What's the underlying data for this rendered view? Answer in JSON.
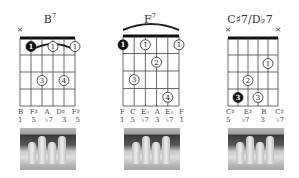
{
  "chords": [
    {
      "name": "B",
      "superscript": "7",
      "muted_strings": [
        1
      ],
      "barre": {
        "fret": 1,
        "from_string": 2,
        "to_string": 6
      },
      "dots": [
        {
          "string": 2,
          "fret": 1,
          "finger": "1",
          "filled": true
        },
        {
          "string": 4,
          "fret": 1,
          "finger": "1",
          "filled": false
        },
        {
          "string": 6,
          "fret": 1,
          "finger": "1",
          "filled": false
        },
        {
          "string": 3,
          "fret": 3,
          "finger": "3",
          "filled": false
        },
        {
          "string": 5,
          "fret": 3,
          "finger": "4",
          "filled": false
        }
      ],
      "notes": [
        "",
        "B",
        "F♯",
        "A",
        "D♯",
        "F♯"
      ],
      "degrees": [
        "",
        "1",
        "5",
        "♭7",
        "3",
        "5"
      ]
    },
    {
      "name": "F",
      "superscript": "7",
      "muted_strings": [],
      "barre": {
        "fret": 1,
        "from_string": 1,
        "to_string": 6
      },
      "dots": [
        {
          "string": 1,
          "fret": 1,
          "finger": "1",
          "filled": true
        },
        {
          "string": 3,
          "fret": 1,
          "finger": "1",
          "filled": false
        },
        {
          "string": 6,
          "fret": 1,
          "finger": "1",
          "filled": false
        },
        {
          "string": 4,
          "fret": 2,
          "finger": "2",
          "filled": false
        },
        {
          "string": 2,
          "fret": 3,
          "finger": "3",
          "filled": false
        },
        {
          "string": 5,
          "fret": 4,
          "finger": "4",
          "filled": false
        }
      ],
      "notes": [
        "F",
        "C",
        "E♭",
        "A",
        "E♭",
        "F"
      ],
      "degrees": [
        "1",
        "5",
        "♭7",
        "3",
        "♭7",
        "1"
      ]
    },
    {
      "name": "C♯7/D♭7",
      "superscript": "",
      "muted_strings": [
        1,
        6
      ],
      "barre": null,
      "dots": [
        {
          "string": 5,
          "fret": 2,
          "finger": "1",
          "filled": false
        },
        {
          "string": 3,
          "fret": 3,
          "finger": "2",
          "filled": false
        },
        {
          "string": 2,
          "fret": 4,
          "finger": "3",
          "filled": true
        },
        {
          "string": 4,
          "fret": 4,
          "finger": "3",
          "filled": false
        }
      ],
      "notes": [
        "",
        "C♯",
        "E♯",
        "B",
        "C♯",
        ""
      ],
      "degrees": [
        "",
        "5",
        "♭7",
        "3",
        "♭7",
        ""
      ]
    }
  ]
}
